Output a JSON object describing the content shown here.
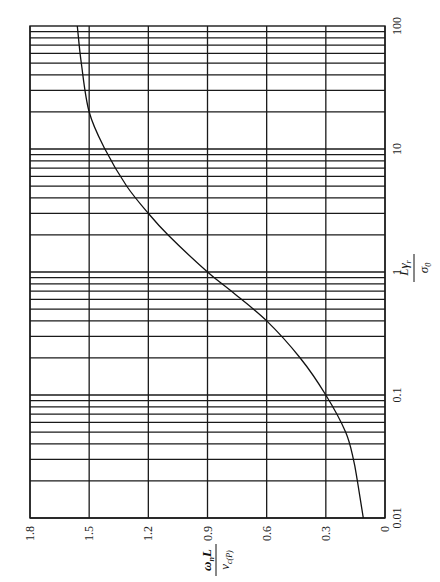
{
  "chart_data": {
    "type": "line",
    "orientation": "rotated 90 degrees clockwise (x axis runs top-to-bottom on right, y axis runs right-to-left along bottom)",
    "title": "",
    "xlabel": "Lγr / σ0",
    "ylabel": "ωn L / vc(P)",
    "xscale": "log",
    "xlim": [
      0.01,
      100
    ],
    "ylim": [
      0,
      1.8
    ],
    "x_ticks": [
      "0.01",
      "0.1",
      "1",
      "10",
      "100"
    ],
    "y_ticks": [
      "0",
      "0.3",
      "0.6",
      "0.9",
      "1.2",
      "1.5",
      "1.8"
    ],
    "grid": true,
    "legend": null,
    "series": [
      {
        "name": "curve",
        "x": [
          0.01,
          0.02,
          0.03,
          0.05,
          0.1,
          0.2,
          0.4,
          0.7,
          1,
          2,
          3,
          5,
          10,
          20,
          50,
          100
        ],
        "y": [
          0.11,
          0.14,
          0.16,
          0.2,
          0.3,
          0.43,
          0.6,
          0.78,
          0.9,
          1.1,
          1.2,
          1.31,
          1.42,
          1.5,
          1.54,
          1.56
        ]
      }
    ]
  },
  "axis_labels": {
    "x_num": "Lγ",
    "x_sub": "r",
    "x_den": "σ",
    "x_den_sub": "0",
    "y_num": "ω",
    "y_num_sub": "n",
    "y_num_tail": "L",
    "y_den": "v",
    "y_den_sub": "c(P)"
  }
}
